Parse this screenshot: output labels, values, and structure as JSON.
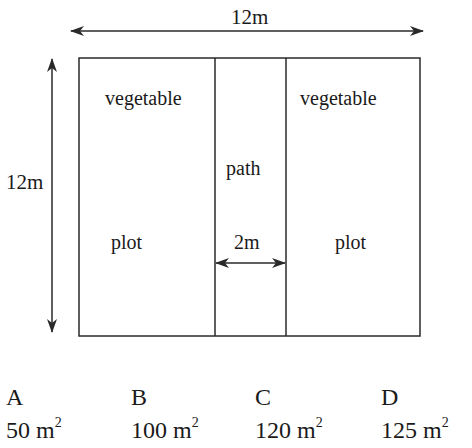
{
  "diagram": {
    "width_label": "12m",
    "height_label": "12m",
    "path_width_label": "2m",
    "left_plot": {
      "top_label": "vegetable",
      "bottom_label": "plot"
    },
    "right_plot": {
      "top_label": "vegetable",
      "bottom_label": "plot"
    },
    "path_label": "path",
    "colors": {
      "stroke": "#2a2a2a",
      "background": "#ffffff"
    }
  },
  "options": [
    {
      "letter": "A",
      "value": "50 m",
      "unit_exp": "2"
    },
    {
      "letter": "B",
      "value": "100 m",
      "unit_exp": "2"
    },
    {
      "letter": "C",
      "value": "120 m",
      "unit_exp": "2"
    },
    {
      "letter": "D",
      "value": "125 m",
      "unit_exp": "2"
    }
  ]
}
